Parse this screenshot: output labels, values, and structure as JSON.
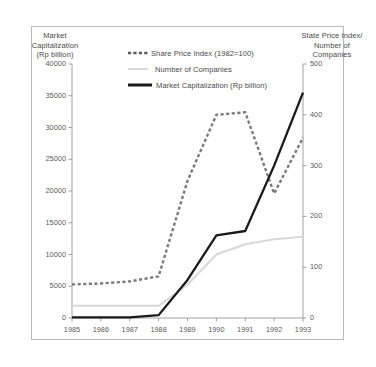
{
  "chart_data": {
    "type": "line",
    "title": "",
    "xlabel": "",
    "x": [
      "1985",
      "1986",
      "1987",
      "1988",
      "1989",
      "1990",
      "1991",
      "1992",
      "1993"
    ],
    "left_axis": {
      "label": "Market Capitalization (Rp billion)",
      "label_lines": [
        "Market",
        "Capitalization",
        "(Rp billion)"
      ],
      "ticks": [
        0,
        5000,
        10000,
        15000,
        20000,
        25000,
        30000,
        35000,
        40000
      ],
      "tick_labels": [
        "0",
        "5000",
        "10000",
        "15000",
        "20000",
        "25000",
        "30000",
        "35000",
        "40000"
      ],
      "ylim": [
        0,
        40000
      ]
    },
    "right_axis": {
      "label": "State Price Index/ Number of Companies",
      "label_lines": [
        "State Price Index/",
        "Number of",
        "Companies"
      ],
      "ticks": [
        0,
        100,
        200,
        300,
        400,
        500
      ],
      "tick_labels": [
        "0",
        "100",
        "200",
        "300",
        "400",
        "500"
      ],
      "ylim": [
        0,
        500
      ]
    },
    "grid": false,
    "legend_position": "top-center",
    "series": [
      {
        "name": "Share Price Index (1982=100)",
        "axis": "right",
        "style": "dashed",
        "color": "#7a7a7a",
        "values": [
          66,
          68,
          72,
          82,
          270,
          400,
          405,
          245,
          355
        ]
      },
      {
        "name": "Number of Companies",
        "axis": "right",
        "style": "solid-thin",
        "color": "#d8d8d8",
        "values": [
          24,
          24,
          24,
          24,
          66,
          125,
          145,
          155,
          160
        ]
      },
      {
        "name": "Market Capitalization (Rp billion)",
        "axis": "left",
        "style": "solid-thick",
        "color": "#1a1a1a",
        "values": [
          100,
          100,
          100,
          450,
          6000,
          13000,
          13700,
          24000,
          35500
        ]
      }
    ]
  },
  "legend": {
    "items": [
      {
        "label": "Share Price Index (1982=100)"
      },
      {
        "label": "Number of Companies"
      },
      {
        "label": "Market Capitalization (Rp billion)"
      }
    ]
  }
}
